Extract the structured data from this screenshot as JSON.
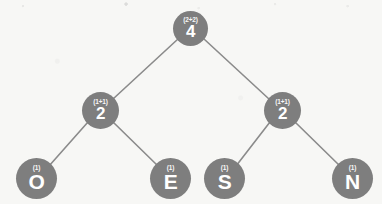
{
  "diagram": {
    "type": "binary-tree",
    "colors": {
      "node_fill": "#7e7e7e",
      "node_text": "#ffffff",
      "edge": "#8b8b8b",
      "background": "#f7f7f5"
    },
    "nodes": [
      {
        "id": "root",
        "label": "4",
        "weight": "(2+2)",
        "role": "root",
        "cx": 191,
        "cy": 28,
        "r": 17.5
      },
      {
        "id": "left",
        "label": "2",
        "weight": "(1+1)",
        "role": "internal",
        "cx": 100,
        "cy": 110,
        "r": 18.5
      },
      {
        "id": "right",
        "label": "2",
        "weight": "(1+1)",
        "role": "internal",
        "cx": 282,
        "cy": 110,
        "r": 18.5
      },
      {
        "id": "leafO",
        "label": "O",
        "weight": "(1)",
        "role": "leaf",
        "cx": 36,
        "cy": 178,
        "r": 20.5
      },
      {
        "id": "leafE",
        "label": "E",
        "weight": "(1)",
        "role": "leaf",
        "cx": 170,
        "cy": 178,
        "r": 20.5
      },
      {
        "id": "leafS",
        "label": "S",
        "weight": "(1)",
        "role": "leaf",
        "cx": 224,
        "cy": 178,
        "r": 20.5
      },
      {
        "id": "leafN",
        "label": "N",
        "weight": "(1)",
        "role": "leaf",
        "cx": 352,
        "cy": 178,
        "r": 20.5
      }
    ],
    "edges": [
      {
        "from": "root",
        "to": "left"
      },
      {
        "from": "root",
        "to": "right"
      },
      {
        "from": "left",
        "to": "leafO"
      },
      {
        "from": "left",
        "to": "leafE"
      },
      {
        "from": "right",
        "to": "leafS"
      },
      {
        "from": "right",
        "to": "leafN"
      }
    ]
  }
}
